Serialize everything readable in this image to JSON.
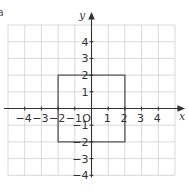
{
  "figure": {
    "part_label": "a"
  },
  "axes": {
    "x_label": "x",
    "y_label": "y",
    "x_range": [
      -5,
      5
    ],
    "y_range": [
      -4,
      5
    ],
    "x_tick_labels": [
      "−4",
      "−3",
      "−2",
      "−1",
      "1",
      "2",
      "3",
      "4"
    ],
    "x_tick_values": [
      -4,
      -3,
      -2,
      -1,
      1,
      2,
      3,
      4
    ],
    "y_tick_labels": [
      "4",
      "3",
      "2",
      "1",
      "−1",
      "−2",
      "−3",
      "−4"
    ],
    "y_tick_values": [
      4,
      3,
      2,
      1,
      -1,
      -2,
      -3,
      -4
    ],
    "origin_label": "O"
  },
  "shapes": [
    {
      "name": "square",
      "vertices": [
        [
          -2,
          2
        ],
        [
          2,
          2
        ],
        [
          2,
          -2
        ],
        [
          -2,
          -2
        ]
      ],
      "color": "#555555"
    }
  ],
  "colors": {
    "grid": "#cfcfcf",
    "axis": "#333333"
  }
}
